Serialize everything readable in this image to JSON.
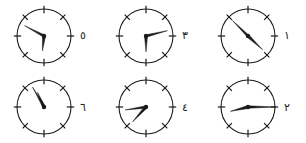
{
  "worksheet": {
    "title": "Telling time — six analog clock faces",
    "background_color": "#ffffff",
    "ink_color": "#1a1a1a",
    "width": 306,
    "height": 143
  },
  "clock_style": {
    "face_radius": 27,
    "tick_count": 8,
    "tick_positions_hours": [
      12,
      1.5,
      3,
      4.5,
      6,
      7.5,
      9,
      10.5
    ],
    "has_numerals_on_face": false,
    "hub_radius": 2.2,
    "rim_stroke": 1.1,
    "hand_color": "#1a1a1a"
  },
  "clocks": [
    {
      "label": "٥",
      "label_latin": "5",
      "position": "top-left",
      "hour_hand": {
        "angle_deg": 186,
        "length": 15
      },
      "minute_hand": {
        "angle_deg": 298,
        "length": 22
      },
      "reads": "6:30"
    },
    {
      "label": "٣",
      "label_latin": "3",
      "position": "top-center",
      "hour_hand": {
        "angle_deg": 180,
        "length": 16
      },
      "minute_hand": {
        "angle_deg": 76,
        "length": 22
      },
      "reads": "6:13"
    },
    {
      "label": "١",
      "label_latin": "1",
      "position": "top-right",
      "hour_hand": {
        "angle_deg": 133,
        "length": 20
      },
      "minute_hand": {
        "angle_deg": 315,
        "length": 22
      },
      "reads": "4:30"
    },
    {
      "label": "٦",
      "label_latin": "6",
      "position": "bottom-left",
      "hour_hand": {
        "angle_deg": 336,
        "length": 16
      },
      "minute_hand": {
        "angle_deg": 330,
        "length": 23
      },
      "reads": "11:00"
    },
    {
      "label": "٤",
      "label_latin": "4",
      "position": "bottom-center",
      "hour_hand": {
        "angle_deg": 222,
        "length": 20
      },
      "minute_hand": {
        "angle_deg": 262,
        "length": 21
      },
      "reads": "7:35"
    },
    {
      "label": "٢",
      "label_latin": "2",
      "position": "bottom-right",
      "hour_hand": {
        "angle_deg": 256,
        "length": 18
      },
      "minute_hand": {
        "angle_deg": 90,
        "length": 28
      },
      "reads": "8:15"
    }
  ]
}
